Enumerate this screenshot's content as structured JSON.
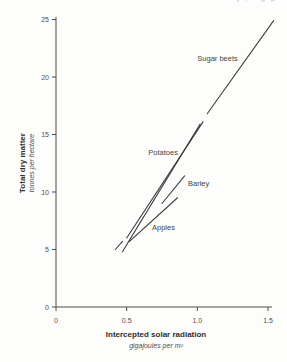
{
  "page": {
    "top_fragment": "y, pp"
  },
  "chart_data": {
    "type": "line",
    "title": "",
    "xlabel": "Intercepted solar radiation",
    "xlabel_sub": "gigajoules per m²",
    "ylabel": "Total dry matter",
    "ylabel_sub": "tonnes per hectare",
    "xlim": [
      0,
      1.5
    ],
    "ylim": [
      0,
      25
    ],
    "grid": false,
    "legend": "inline-labels",
    "x_ticks": [
      {
        "value": 0,
        "label": "0"
      },
      {
        "value": 0.5,
        "label": "0.5"
      },
      {
        "value": 1.0,
        "label": "1.0"
      },
      {
        "value": 1.5,
        "label": "1.5"
      }
    ],
    "y_ticks": [
      {
        "value": 0,
        "label": "0"
      },
      {
        "value": 5,
        "label": "5"
      },
      {
        "value": 10,
        "label": "10"
      },
      {
        "value": 15,
        "label": "15"
      },
      {
        "value": 20,
        "label": "20"
      },
      {
        "value": 25,
        "label": "25"
      }
    ],
    "line_color": "#3d3d3d",
    "series": [
      {
        "name": "Sugar beets",
        "label": {
          "text": "Sugar beets",
          "x": 1.286,
          "y": 21.35,
          "anchor": "end"
        },
        "segments": [
          [
            [
              0.47,
              4.8
            ],
            [
              1.02,
              15.9
            ]
          ],
          [
            [
              1.07,
              16.8
            ],
            [
              1.54,
              24.9
            ]
          ]
        ]
      },
      {
        "name": "Potatoes",
        "label": {
          "text": "Potatoes",
          "x": 0.863,
          "y": 13.2,
          "anchor": "end"
        },
        "segments": [
          [
            [
              0.42,
              5.0
            ],
            [
              0.47,
              5.7
            ]
          ],
          [
            [
              0.5,
              6.0
            ],
            [
              1.04,
              16.1
            ]
          ]
        ]
      },
      {
        "name": "Barley",
        "label": {
          "text": "Barley",
          "x": 0.934,
          "y": 10.5,
          "anchor": "start"
        },
        "segments": [
          [
            [
              0.75,
              9.0
            ],
            [
              0.91,
              11.4
            ]
          ]
        ]
      },
      {
        "name": "Apples",
        "label": {
          "text": "Apples",
          "x": 0.679,
          "y": 6.7,
          "anchor": "start"
        },
        "segments": [
          [
            [
              0.52,
              5.7
            ],
            [
              0.86,
              9.5
            ]
          ]
        ]
      }
    ]
  }
}
